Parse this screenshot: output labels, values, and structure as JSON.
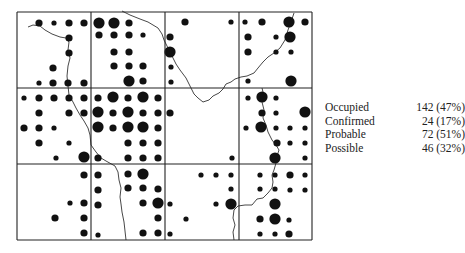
{
  "map": {
    "grid": {
      "x_lines": [
        17,
        91,
        165,
        239,
        312
      ],
      "y_lines": [
        12,
        88,
        164,
        240
      ]
    },
    "dot_radius": {
      "small": 2.6,
      "medium": 3.6,
      "large": 5.6
    },
    "dots": [
      {
        "x": 39,
        "y": 23,
        "s": "medium"
      },
      {
        "x": 54,
        "y": 23,
        "s": "small"
      },
      {
        "x": 69,
        "y": 23,
        "s": "medium"
      },
      {
        "x": 84,
        "y": 23,
        "s": "medium"
      },
      {
        "x": 69,
        "y": 38,
        "s": "medium"
      },
      {
        "x": 69,
        "y": 53,
        "s": "medium"
      },
      {
        "x": 53,
        "y": 68,
        "s": "medium"
      },
      {
        "x": 39,
        "y": 83,
        "s": "small"
      },
      {
        "x": 53,
        "y": 83,
        "s": "medium"
      },
      {
        "x": 68,
        "y": 83,
        "s": "medium"
      },
      {
        "x": 84,
        "y": 83,
        "s": "medium"
      },
      {
        "x": 99,
        "y": 23,
        "s": "large"
      },
      {
        "x": 114,
        "y": 23,
        "s": "large"
      },
      {
        "x": 129,
        "y": 23,
        "s": "medium"
      },
      {
        "x": 99,
        "y": 35,
        "s": "medium"
      },
      {
        "x": 114,
        "y": 35,
        "s": "medium"
      },
      {
        "x": 129,
        "y": 35,
        "s": "medium"
      },
      {
        "x": 143,
        "y": 35,
        "s": "small"
      },
      {
        "x": 114,
        "y": 52,
        "s": "medium"
      },
      {
        "x": 129,
        "y": 52,
        "s": "medium"
      },
      {
        "x": 114,
        "y": 66,
        "s": "medium"
      },
      {
        "x": 129,
        "y": 66,
        "s": "medium"
      },
      {
        "x": 143,
        "y": 66,
        "s": "medium"
      },
      {
        "x": 129,
        "y": 81,
        "s": "large"
      },
      {
        "x": 143,
        "y": 81,
        "s": "medium"
      },
      {
        "x": 185,
        "y": 22,
        "s": "medium"
      },
      {
        "x": 231,
        "y": 22,
        "s": "small"
      },
      {
        "x": 170,
        "y": 37,
        "s": "medium"
      },
      {
        "x": 170,
        "y": 52,
        "s": "large"
      },
      {
        "x": 171,
        "y": 67,
        "s": "small"
      },
      {
        "x": 171,
        "y": 82,
        "s": "small"
      },
      {
        "x": 245,
        "y": 22,
        "s": "small"
      },
      {
        "x": 262,
        "y": 22,
        "s": "medium"
      },
      {
        "x": 289,
        "y": 22,
        "s": "large"
      },
      {
        "x": 305,
        "y": 22,
        "s": "medium"
      },
      {
        "x": 248,
        "y": 37,
        "s": "medium"
      },
      {
        "x": 276,
        "y": 37,
        "s": "small"
      },
      {
        "x": 290,
        "y": 37,
        "s": "large"
      },
      {
        "x": 248,
        "y": 52,
        "s": "medium"
      },
      {
        "x": 276,
        "y": 52,
        "s": "small"
      },
      {
        "x": 291,
        "y": 52,
        "s": "small"
      },
      {
        "x": 248,
        "y": 81,
        "s": "small"
      },
      {
        "x": 291,
        "y": 81,
        "s": "large"
      },
      {
        "x": 24,
        "y": 98,
        "s": "small"
      },
      {
        "x": 39,
        "y": 98,
        "s": "medium"
      },
      {
        "x": 54,
        "y": 98,
        "s": "medium"
      },
      {
        "x": 69,
        "y": 98,
        "s": "medium"
      },
      {
        "x": 84,
        "y": 98,
        "s": "medium"
      },
      {
        "x": 39,
        "y": 113,
        "s": "medium"
      },
      {
        "x": 69,
        "y": 113,
        "s": "medium"
      },
      {
        "x": 84,
        "y": 113,
        "s": "medium"
      },
      {
        "x": 24,
        "y": 128,
        "s": "medium"
      },
      {
        "x": 39,
        "y": 128,
        "s": "medium"
      },
      {
        "x": 54,
        "y": 128,
        "s": "small"
      },
      {
        "x": 39,
        "y": 143,
        "s": "medium"
      },
      {
        "x": 69,
        "y": 143,
        "s": "small"
      },
      {
        "x": 56,
        "y": 158,
        "s": "small"
      },
      {
        "x": 84,
        "y": 157,
        "s": "large"
      },
      {
        "x": 98,
        "y": 98,
        "s": "medium"
      },
      {
        "x": 113,
        "y": 97,
        "s": "large"
      },
      {
        "x": 128,
        "y": 98,
        "s": "medium"
      },
      {
        "x": 143,
        "y": 97,
        "s": "large"
      },
      {
        "x": 158,
        "y": 98,
        "s": "medium"
      },
      {
        "x": 98,
        "y": 112,
        "s": "large"
      },
      {
        "x": 113,
        "y": 113,
        "s": "medium"
      },
      {
        "x": 128,
        "y": 112,
        "s": "large"
      },
      {
        "x": 143,
        "y": 113,
        "s": "medium"
      },
      {
        "x": 158,
        "y": 113,
        "s": "medium"
      },
      {
        "x": 98,
        "y": 127,
        "s": "large"
      },
      {
        "x": 113,
        "y": 128,
        "s": "medium"
      },
      {
        "x": 128,
        "y": 127,
        "s": "large"
      },
      {
        "x": 143,
        "y": 127,
        "s": "large"
      },
      {
        "x": 158,
        "y": 128,
        "s": "medium"
      },
      {
        "x": 128,
        "y": 143,
        "s": "medium"
      },
      {
        "x": 143,
        "y": 143,
        "s": "medium"
      },
      {
        "x": 158,
        "y": 143,
        "s": "medium"
      },
      {
        "x": 98,
        "y": 158,
        "s": "medium"
      },
      {
        "x": 128,
        "y": 158,
        "s": "medium"
      },
      {
        "x": 143,
        "y": 158,
        "s": "medium"
      },
      {
        "x": 158,
        "y": 158,
        "s": "medium"
      },
      {
        "x": 170,
        "y": 113,
        "s": "medium"
      },
      {
        "x": 232,
        "y": 158,
        "s": "small"
      },
      {
        "x": 248,
        "y": 98,
        "s": "small"
      },
      {
        "x": 262,
        "y": 97,
        "s": "large"
      },
      {
        "x": 276,
        "y": 98,
        "s": "small"
      },
      {
        "x": 262,
        "y": 113,
        "s": "medium"
      },
      {
        "x": 276,
        "y": 113,
        "s": "small"
      },
      {
        "x": 305,
        "y": 112,
        "s": "large"
      },
      {
        "x": 246,
        "y": 128,
        "s": "small"
      },
      {
        "x": 261,
        "y": 127,
        "s": "large"
      },
      {
        "x": 276,
        "y": 128,
        "s": "small"
      },
      {
        "x": 290,
        "y": 128,
        "s": "small"
      },
      {
        "x": 305,
        "y": 128,
        "s": "small"
      },
      {
        "x": 277,
        "y": 143,
        "s": "medium"
      },
      {
        "x": 290,
        "y": 143,
        "s": "small"
      },
      {
        "x": 305,
        "y": 143,
        "s": "small"
      },
      {
        "x": 275,
        "y": 158,
        "s": "large"
      },
      {
        "x": 305,
        "y": 158,
        "s": "small"
      },
      {
        "x": 84,
        "y": 175,
        "s": "medium"
      },
      {
        "x": 70,
        "y": 203,
        "s": "small"
      },
      {
        "x": 84,
        "y": 203,
        "s": "medium"
      },
      {
        "x": 55,
        "y": 218,
        "s": "medium"
      },
      {
        "x": 84,
        "y": 218,
        "s": "medium"
      },
      {
        "x": 84,
        "y": 233,
        "s": "medium"
      },
      {
        "x": 98,
        "y": 175,
        "s": "medium"
      },
      {
        "x": 128,
        "y": 174,
        "s": "medium"
      },
      {
        "x": 143,
        "y": 174,
        "s": "large"
      },
      {
        "x": 98,
        "y": 190,
        "s": "medium"
      },
      {
        "x": 128,
        "y": 188,
        "s": "medium"
      },
      {
        "x": 143,
        "y": 188,
        "s": "medium"
      },
      {
        "x": 158,
        "y": 189,
        "s": "medium"
      },
      {
        "x": 98,
        "y": 205,
        "s": "medium"
      },
      {
        "x": 143,
        "y": 203,
        "s": "medium"
      },
      {
        "x": 158,
        "y": 203,
        "s": "large"
      },
      {
        "x": 158,
        "y": 218,
        "s": "medium"
      },
      {
        "x": 98,
        "y": 235,
        "s": "small"
      },
      {
        "x": 143,
        "y": 233,
        "s": "medium"
      },
      {
        "x": 158,
        "y": 233,
        "s": "medium"
      },
      {
        "x": 201,
        "y": 175,
        "s": "small"
      },
      {
        "x": 216,
        "y": 175,
        "s": "small"
      },
      {
        "x": 231,
        "y": 175,
        "s": "small"
      },
      {
        "x": 231,
        "y": 189,
        "s": "small"
      },
      {
        "x": 170,
        "y": 204,
        "s": "small"
      },
      {
        "x": 216,
        "y": 204,
        "s": "small"
      },
      {
        "x": 231,
        "y": 204,
        "s": "large"
      },
      {
        "x": 186,
        "y": 219,
        "s": "small"
      },
      {
        "x": 170,
        "y": 234,
        "s": "small"
      },
      {
        "x": 260,
        "y": 175,
        "s": "small"
      },
      {
        "x": 275,
        "y": 175,
        "s": "small"
      },
      {
        "x": 290,
        "y": 175,
        "s": "medium"
      },
      {
        "x": 305,
        "y": 175,
        "s": "small"
      },
      {
        "x": 260,
        "y": 189,
        "s": "small"
      },
      {
        "x": 275,
        "y": 189,
        "s": "small"
      },
      {
        "x": 290,
        "y": 190,
        "s": "small"
      },
      {
        "x": 305,
        "y": 190,
        "s": "small"
      },
      {
        "x": 275,
        "y": 204,
        "s": "large"
      },
      {
        "x": 260,
        "y": 219,
        "s": "medium"
      },
      {
        "x": 275,
        "y": 219,
        "s": "large"
      },
      {
        "x": 289,
        "y": 220,
        "s": "small"
      },
      {
        "x": 260,
        "y": 234,
        "s": "small"
      },
      {
        "x": 275,
        "y": 234,
        "s": "small"
      },
      {
        "x": 289,
        "y": 234,
        "s": "medium"
      }
    ],
    "rivers": [
      "M 28 27 L 33 25 L 40 26 L 45 30 L 52 34 L 60 37 L 66 38 L 69 42 L 68 50 L 70 58 L 68 66 L 67 76 L 68 86 L 69 95 L 73 102 L 76 108 L 80 115 L 84 121 L 88 128 L 90 135 L 91 145 L 96 152 L 101 158 L 106 161 L 115 166 L 118 172 L 119 180 L 121 188 L 120 197 L 121 204 L 122 212 L 124 222 L 126 240",
      "M 122 11 L 130 15 L 140 19 L 148 22 L 158 28 L 162 34 L 164 40 L 167 46 L 170 52 L 173 58 L 176 64 L 180 70 L 186 78 L 190 86 L 194 94 L 198 98 L 203 102 L 209 100 L 213 96 L 219 93 L 223 89 L 226 84 L 231 82 L 235 79 L 241 77 L 247 76 L 254 73 L 258 68 L 263 62 L 268 57 L 274 53 L 280 48 L 285 40 L 288 30 L 291 22 L 294 13",
      "M 262 88 L 264 96 L 262 102 L 264 110 L 263 118 L 266 125 L 268 132 L 272 140 L 276 145 L 279 150 L 277 156 L 276 163 L 274 170 L 272 175 L 273 182 L 272 188 L 268 193 L 263 198 L 257 199 L 252 205 L 245 205 L 238 206 L 234 210 L 233 218 L 235 225 L 233 232 L 234 240"
    ]
  },
  "legend": {
    "rows": [
      {
        "label": "Occupied",
        "value": "142 (47%)"
      },
      {
        "label": "Confirmed",
        "value": "24 (17%)"
      },
      {
        "label": "Probable",
        "value": "72 (51%)"
      },
      {
        "label": "Possible",
        "value": "46 (32%)"
      }
    ]
  }
}
